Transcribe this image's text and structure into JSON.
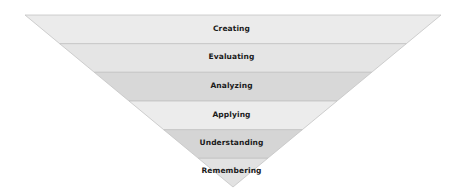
{
  "diagram": {
    "type": "inverted-pyramid",
    "title": "",
    "levels": [
      {
        "label": "Creating",
        "fill": "#ebebeb"
      },
      {
        "label": "Evaluating",
        "fill": "#e5e5e5"
      },
      {
        "label": "Analyzing",
        "fill": "#d8d8d8"
      },
      {
        "label": "Applying",
        "fill": "#ececec"
      },
      {
        "label": "Understanding",
        "fill": "#d5d5d5"
      },
      {
        "label": "Remembering",
        "fill": "#e2e2e2"
      }
    ],
    "colors": {
      "separator": "#c4c4c4",
      "outline": "#cfcfcf",
      "text": "#1a1a1a",
      "background": "#ffffff"
    }
  }
}
